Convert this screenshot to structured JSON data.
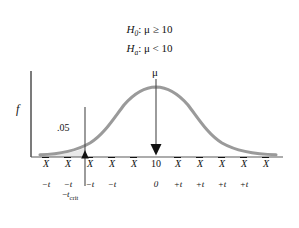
{
  "figure": {
    "title_lines": [
      {
        "prefix": "H",
        "sub": "0",
        "text": ": μ ≥ 10"
      },
      {
        "prefix": "H",
        "sub": "a",
        "text": ": μ < 10"
      }
    ],
    "y_axis_label": "f",
    "alpha_label": ".05",
    "mu_label": "μ",
    "critical_label_prefix": "−",
    "critical_label_t": "t",
    "critical_label_sub": "crit",
    "colors": {
      "curve": "#9a9a9a",
      "axis": "#5a5a5a",
      "text": "#111111",
      "shade": "#e8e8e8",
      "arrow": "#4a4a4a"
    }
  },
  "axis": {
    "xbar_symbol": "X",
    "center_value": "10",
    "tick_positions": [
      46,
      68,
      90,
      112,
      134,
      156,
      178,
      200,
      222,
      244,
      266
    ],
    "xbar_row": [
      "X",
      "X",
      "X",
      "X",
      "X",
      "10",
      "X",
      "X",
      "X",
      "X",
      "X"
    ],
    "t_row": [
      "−t",
      "−t",
      "−t",
      "−t",
      "0",
      "+t",
      "+t",
      "+t",
      "+t"
    ],
    "t_positions": [
      46,
      68,
      90,
      112,
      156,
      178,
      200,
      222,
      244
    ]
  },
  "chart_data": {
    "type": "line",
    "xlabel": "",
    "ylabel": "f",
    "curve": "normal density",
    "mean_label": "10",
    "critical_value_x": 85,
    "rejection_region_alpha": 0.05,
    "tail": "left"
  }
}
